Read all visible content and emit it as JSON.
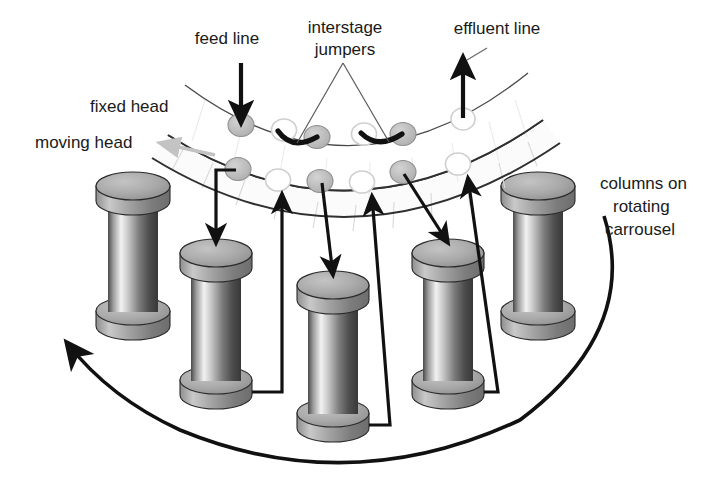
{
  "figure": {
    "background_color": "#ffffff",
    "line_color": "#111111",
    "column_gray": "#a9a9a9",
    "port_fill_gray": "#b9b9b9",
    "port_open_fill": "#ffffff",
    "moving_head_arrow_color": "#c3c3c3"
  },
  "labels": [
    {
      "id": "feed-line",
      "text": "feed line",
      "x": 227,
      "y": 44,
      "anchor": "middle"
    },
    {
      "id": "interstage-jumpers",
      "lines": [
        "interstage",
        "jumpers"
      ],
      "line1": "interstage",
      "line2": "jumpers",
      "x": 345,
      "y": 40,
      "anchor": "middle"
    },
    {
      "id": "effluent-line",
      "text": "effluent line",
      "x": 497,
      "y": 40,
      "anchor": "middle"
    },
    {
      "id": "fixed-head",
      "text": "fixed head",
      "x": 90,
      "y": 112,
      "anchor": "start"
    },
    {
      "id": "moving-head",
      "text": "moving head",
      "x": 35,
      "y": 148,
      "anchor": "start"
    },
    {
      "id": "columns-on-rotating-carrousel",
      "lines": [
        "columns on",
        "rotating",
        "carrousel"
      ],
      "line1": "columns on",
      "line2": "rotating",
      "line3": "carrousel",
      "x": 600,
      "y": 189,
      "anchor": "start"
    }
  ],
  "columns": [
    {
      "id": "column-1",
      "cx": 133,
      "top_y": 186,
      "height": 140,
      "radius_x": 37,
      "radius_y": 14,
      "body_half_width": 25
    },
    {
      "id": "column-2",
      "cx": 216,
      "top_y": 253,
      "height": 142,
      "radius_x": 36,
      "radius_y": 14,
      "body_half_width": 25
    },
    {
      "id": "column-3",
      "cx": 333,
      "top_y": 285,
      "height": 142,
      "radius_x": 36,
      "radius_y": 14,
      "body_half_width": 25
    },
    {
      "id": "column-4",
      "cx": 448,
      "top_y": 253,
      "height": 142,
      "radius_x": 36,
      "radius_y": 14,
      "body_half_width": 25
    },
    {
      "id": "column-5",
      "cx": 538,
      "top_y": 186,
      "height": 140,
      "radius_x": 37,
      "radius_y": 14,
      "body_half_width": 25
    }
  ],
  "plates": [
    {
      "id": "fixed-head-plate",
      "name": "fixed head"
    },
    {
      "id": "moving-head-plate",
      "name": "moving head"
    }
  ],
  "ports": {
    "fixed_head_filled": [
      {
        "id": "port-feed",
        "cx": 241,
        "cy": 125
      },
      {
        "id": "port-fh-2",
        "cx": 317,
        "cy": 137
      },
      {
        "id": "port-fh-3",
        "cx": 403,
        "cy": 134
      }
    ],
    "fixed_head_open": [
      {
        "id": "port-fh-open-1",
        "cx": 284,
        "cy": 130
      },
      {
        "id": "port-fh-open-2",
        "cx": 364,
        "cy": 134
      },
      {
        "id": "port-effluent",
        "cx": 463,
        "cy": 119
      }
    ],
    "moving_head_filled": [
      {
        "id": "port-mh-1",
        "cx": 238,
        "cy": 169
      },
      {
        "id": "port-mh-2",
        "cx": 320,
        "cy": 181
      },
      {
        "id": "port-mh-3",
        "cx": 403,
        "cy": 172
      }
    ],
    "moving_head_open": [
      {
        "id": "port-mh-open-1",
        "cx": 278,
        "cy": 180
      },
      {
        "id": "port-mh-open-2",
        "cx": 362,
        "cy": 182
      },
      {
        "id": "port-mh-open-3",
        "cx": 458,
        "cy": 164
      }
    ]
  },
  "flow": {
    "feed_arrow": "down into fixed head port",
    "effluent_arrow": "up from fixed head port",
    "jumpers_count": 2,
    "down_arrows_count": 3,
    "up_arrows_count": 3,
    "rotation_direction": "counterclockwise"
  }
}
